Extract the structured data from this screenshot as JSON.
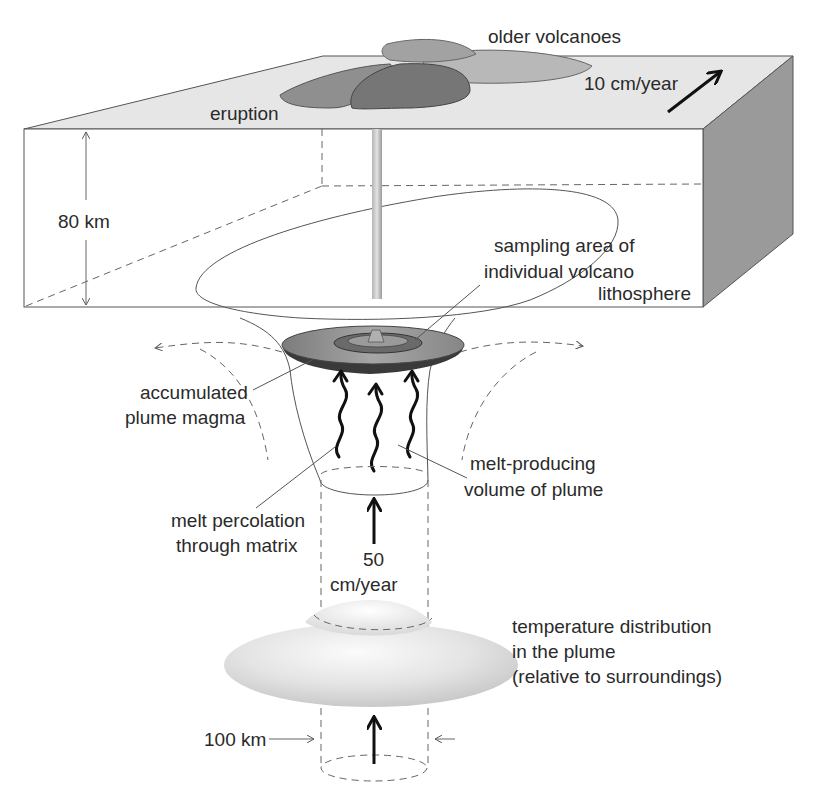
{
  "figure": {
    "type": "mantle-plume-cross-section",
    "labels": {
      "older_volcanoes": "older volcanoes",
      "eruption": "eruption",
      "plate_speed": "10 cm/year",
      "lithosphere_thickness": "80 km",
      "sampling_area_line1": "sampling area of",
      "sampling_area_line2": "individual volcano",
      "lithosphere": "lithosphere",
      "accumulated_line1": "accumulated",
      "accumulated_line2": "plume magma",
      "melt_producing_line1": "melt-producing",
      "melt_producing_line2": "volume of plume",
      "percolation_line1": "melt percolation",
      "percolation_line2": "through matrix",
      "plume_speed_value": "50",
      "plume_speed_unit": "cm/year",
      "temperature_line1": "temperature distribution",
      "temperature_line2": "in the plume",
      "temperature_line3": "(relative to surroundings)",
      "plume_width": "100 km"
    },
    "colors": {
      "lithosphere_top": "#e6e6e6",
      "lithosphere_side": "#9a9a9a",
      "eruption_volcano": "#7a7a7a",
      "older_volcano_mid": "#9c9c9c",
      "older_volcano_light": "#b8b8b8",
      "magma_disk": "#8c8c8c",
      "magma_disk_inner": "#6a6a6a",
      "temperature_blob": "#d8d8d8",
      "line": "#555555",
      "arrow": "#111111"
    }
  }
}
